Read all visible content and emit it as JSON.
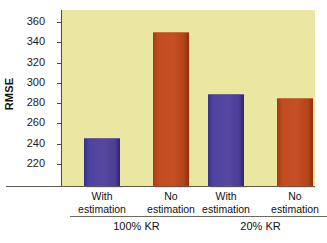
{
  "chart_data": {
    "type": "bar",
    "title": "",
    "xlabel": "",
    "ylabel": "RMSE",
    "ylim": [
      198,
      372
    ],
    "yticks": [
      220,
      240,
      260,
      280,
      300,
      320,
      340,
      360
    ],
    "ytick_labels": [
      "220",
      "240",
      "260",
      "280",
      "300",
      "320",
      "340",
      "360"
    ],
    "grid": false,
    "legend": "none",
    "categories": [
      "With estimation",
      "No estimation",
      "With estimation",
      "No estimation"
    ],
    "values": [
      245,
      350,
      289,
      285
    ],
    "bar_colors": [
      "#56489f",
      "#c65026",
      "#56489f",
      "#c65026"
    ],
    "groups": [
      {
        "label": "100% KR",
        "categories": [
          "With estimation",
          "No estimation"
        ],
        "values": [
          245,
          350
        ]
      },
      {
        "label": "20% KR",
        "categories": [
          "With estimation",
          "No estimation"
        ],
        "values": [
          289,
          285
        ]
      }
    ],
    "plot_background": "#e9e7a2",
    "figure_background": "#ffffff"
  },
  "axis": {
    "y_title": "RMSE",
    "ticks": [
      {
        "value": 360,
        "label": "360"
      },
      {
        "value": 340,
        "label": "340"
      },
      {
        "value": 320,
        "label": "320"
      },
      {
        "value": 300,
        "label": "300"
      },
      {
        "value": 280,
        "label": "280"
      },
      {
        "value": 260,
        "label": "260"
      },
      {
        "value": 240,
        "label": "240"
      },
      {
        "value": 220,
        "label": "220"
      }
    ]
  },
  "bars": [
    {
      "label_line1": "With",
      "label_line2": "estimation",
      "value": 245,
      "color": "blue"
    },
    {
      "label_line1": "No",
      "label_line2": "estimation",
      "value": 350,
      "color": "red"
    },
    {
      "label_line1": "With",
      "label_line2": "estimation",
      "value": 289,
      "color": "blue"
    },
    {
      "label_line1": "No",
      "label_line2": "estimation",
      "value": 285,
      "color": "red"
    }
  ],
  "groups": [
    {
      "label": "100% KR"
    },
    {
      "label": "20% KR"
    }
  ]
}
